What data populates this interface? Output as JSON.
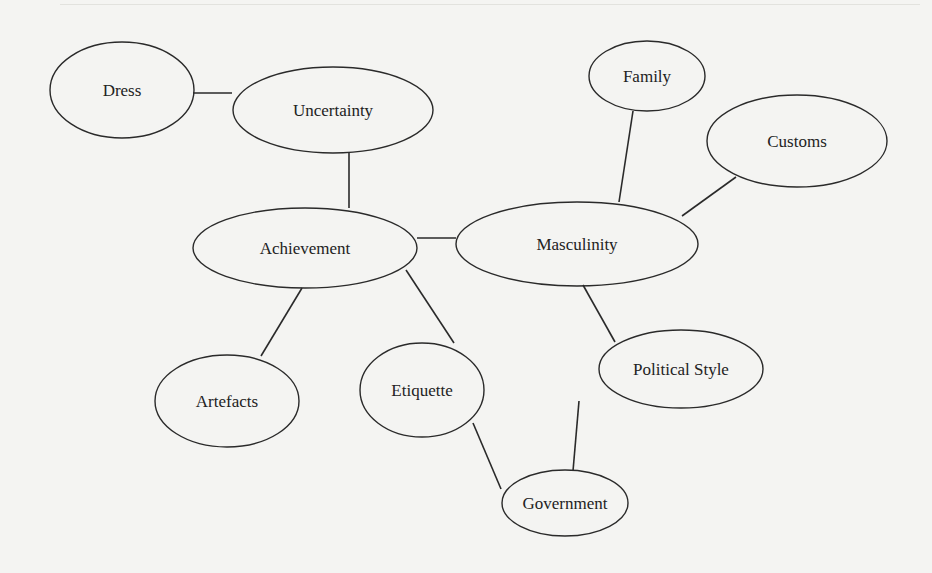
{
  "diagram": {
    "type": "concept-map",
    "nodes": [
      {
        "id": "dress",
        "label": "Dress",
        "cx": 122,
        "cy": 90,
        "rx": 72,
        "ry": 48
      },
      {
        "id": "uncertainty",
        "label": "Uncertainty",
        "cx": 333,
        "cy": 110,
        "rx": 100,
        "ry": 43
      },
      {
        "id": "family",
        "label": "Family",
        "cx": 647,
        "cy": 76,
        "rx": 58,
        "ry": 35
      },
      {
        "id": "customs",
        "label": "Customs",
        "cx": 797,
        "cy": 141,
        "rx": 90,
        "ry": 46
      },
      {
        "id": "achievement",
        "label": "Achievement",
        "cx": 305,
        "cy": 248,
        "rx": 112,
        "ry": 40
      },
      {
        "id": "masculinity",
        "label": "Masculinity",
        "cx": 577,
        "cy": 244,
        "rx": 121,
        "ry": 42
      },
      {
        "id": "artefacts",
        "label": "Artefacts",
        "cx": 227,
        "cy": 401,
        "rx": 72,
        "ry": 46
      },
      {
        "id": "etiquette",
        "label": "Etiquette",
        "cx": 422,
        "cy": 390,
        "rx": 62,
        "ry": 47
      },
      {
        "id": "political_style",
        "label": "Political Style",
        "cx": 681,
        "cy": 369,
        "rx": 82,
        "ry": 39
      },
      {
        "id": "government",
        "label": "Government",
        "cx": 565,
        "cy": 503,
        "rx": 63,
        "ry": 33
      }
    ],
    "edges": [
      {
        "from": "dress",
        "to": "uncertainty",
        "x1": 193,
        "y1": 93,
        "x2": 232,
        "y2": 93
      },
      {
        "from": "uncertainty",
        "to": "achievement",
        "x1": 349,
        "y1": 153,
        "x2": 349,
        "y2": 208
      },
      {
        "from": "achievement",
        "to": "masculinity",
        "x1": 417,
        "y1": 238,
        "x2": 456,
        "y2": 238
      },
      {
        "from": "family",
        "to": "masculinity",
        "x1": 633,
        "y1": 111,
        "x2": 619,
        "y2": 202
      },
      {
        "from": "customs",
        "to": "masculinity",
        "x1": 736,
        "y1": 177,
        "x2": 682,
        "y2": 216
      },
      {
        "from": "achievement",
        "to": "artefacts",
        "x1": 302,
        "y1": 288,
        "x2": 261,
        "y2": 356
      },
      {
        "from": "achievement",
        "to": "etiquette",
        "x1": 406,
        "y1": 270,
        "x2": 454,
        "y2": 343
      },
      {
        "from": "masculinity",
        "to": "political_style",
        "x1": 583,
        "y1": 285,
        "x2": 615,
        "y2": 342
      },
      {
        "from": "etiquette",
        "to": "government",
        "x1": 473,
        "y1": 423,
        "x2": 501,
        "y2": 489
      },
      {
        "from": "political_style",
        "to": "government",
        "x1": 579,
        "y1": 401,
        "x2": 573,
        "y2": 471
      }
    ],
    "colors": {
      "stroke": "#2a2a2a",
      "background": "#f4f4f2",
      "text": "#222222"
    }
  }
}
